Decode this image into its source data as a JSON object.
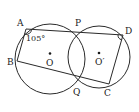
{
  "diagram": {
    "circles": [
      {
        "name": "O",
        "cx": 50,
        "cy": 59,
        "r": 35
      },
      {
        "name": "O'",
        "cx": 99,
        "cy": 57,
        "r": 31
      }
    ],
    "points": {
      "A": {
        "x": 26,
        "y": 29
      },
      "P": {
        "x": 77,
        "y": 31
      },
      "D": {
        "x": 123,
        "y": 35
      },
      "B": {
        "x": 17,
        "y": 61
      },
      "Q": {
        "x": 77,
        "y": 83
      },
      "C": {
        "x": 109,
        "y": 84
      },
      "O": {
        "x": 50,
        "y": 57
      },
      "O'": {
        "x": 99,
        "y": 55
      }
    },
    "segments": [
      [
        "A",
        "D"
      ],
      [
        "A",
        "B"
      ],
      [
        "B",
        "C"
      ],
      [
        "D",
        "C"
      ],
      [
        "P",
        "Q"
      ]
    ],
    "labels": {
      "A": "A",
      "P": "P",
      "D": "D",
      "B": "B",
      "O": "O",
      "O_prime": "O′",
      "Q": "Q",
      "C": "C",
      "angle_A": "105°"
    },
    "colors": {
      "stroke": "#2a2a2a",
      "text": "#222222",
      "background": "#ffffff"
    }
  }
}
